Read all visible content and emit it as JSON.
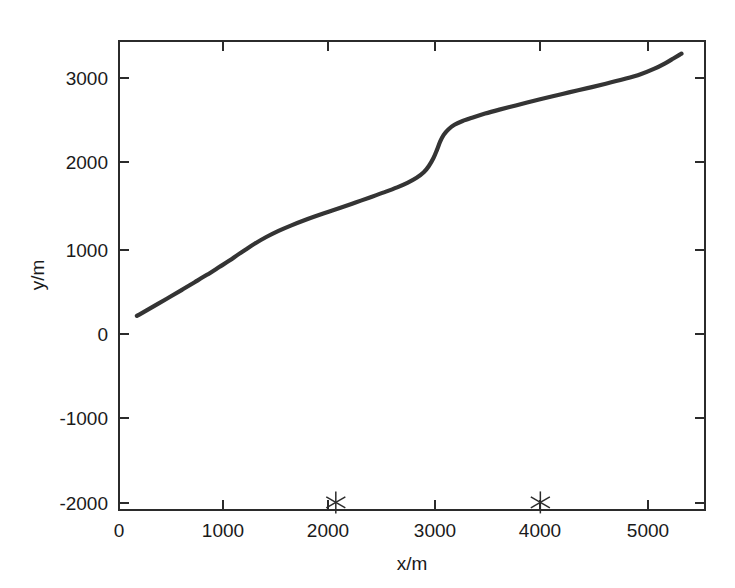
{
  "chart_data": {
    "type": "line",
    "title": "",
    "xlabel": "x/m",
    "ylabel": "y/m",
    "xlim": [
      -120,
      5610
    ],
    "ylim": [
      -2090,
      3480
    ],
    "xticks": [
      0,
      1000,
      2000,
      3000,
      4000,
      5000
    ],
    "xticklabels": [
      "0",
      "1000",
      "2000",
      "3000",
      "4000",
      "5000"
    ],
    "yticks": [
      -2000,
      -1000,
      0,
      1000,
      2000,
      3000
    ],
    "yticklabels": [
      "-2000",
      "-1000",
      "0",
      "1000",
      "2000",
      "3000"
    ],
    "grid": false,
    "legend": null,
    "box": true,
    "tick_direction": "in",
    "series": [
      {
        "name": "trajectory",
        "style": "solid-line",
        "color": "#343434",
        "linewidth": 4.2,
        "x": [
          55,
          150,
          260,
          380,
          500,
          620,
          740,
          860,
          960,
          1040,
          1120,
          1210,
          1320,
          1440,
          1560,
          1680,
          1800,
          1930,
          2060,
          2200,
          2340,
          2470,
          2600,
          2700,
          2790,
          2860,
          2910,
          2955,
          2990,
          3020,
          3055,
          3100,
          3160,
          3240,
          3340,
          3460,
          3600,
          3760,
          3930,
          4100,
          4280,
          4460,
          4640,
          4820,
          4980,
          5110,
          5220,
          5300,
          5360,
          5380
        ],
        "y": [
          215,
          280,
          358,
          442,
          528,
          615,
          703,
          795,
          872,
          940,
          1005,
          1075,
          1152,
          1225,
          1288,
          1345,
          1398,
          1452,
          1505,
          1565,
          1625,
          1682,
          1742,
          1795,
          1855,
          1920,
          1995,
          2090,
          2190,
          2285,
          2365,
          2430,
          2485,
          2530,
          2572,
          2618,
          2665,
          2715,
          2768,
          2818,
          2870,
          2920,
          2972,
          3028,
          3085,
          3148,
          3215,
          3272,
          3315,
          3330
        ]
      },
      {
        "name": "beacons",
        "style": "star-markers",
        "color": "#2b2b2b",
        "marker": "asterisk",
        "x": [
          2000,
          4000
        ],
        "y": [
          -2000,
          -2000
        ]
      }
    ]
  },
  "figure": {
    "background_color": "#ffffff",
    "axes_color": "#2b2b2b",
    "curve_color": "#343434",
    "marker_color": "#2b2b2b"
  }
}
